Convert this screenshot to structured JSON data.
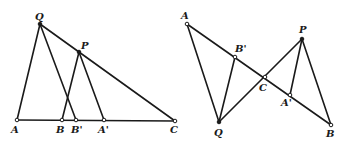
{
  "figures": [
    {
      "id": "left",
      "points": {
        "Q": {
          "label": "Q",
          "x": 40,
          "y": 24,
          "style": "solid",
          "lx": 35,
          "ly": 20
        },
        "P": {
          "label": "P",
          "x": 79,
          "y": 52,
          "style": "solid",
          "lx": 81,
          "ly": 49
        },
        "A": {
          "label": "A",
          "x": 17,
          "y": 120,
          "style": "open",
          "lx": 11,
          "ly": 133
        },
        "B": {
          "label": "B",
          "x": 62,
          "y": 120,
          "style": "open",
          "lx": 56,
          "ly": 133
        },
        "B'": {
          "label": "B'",
          "x": 76,
          "y": 120,
          "style": "open",
          "lx": 71,
          "ly": 133
        },
        "A'": {
          "label": "A'",
          "x": 104,
          "y": 120,
          "style": "open",
          "lx": 98,
          "ly": 133
        },
        "C": {
          "label": "C",
          "x": 175,
          "y": 121,
          "style": "open",
          "lx": 170,
          "ly": 133
        }
      },
      "segments": [
        [
          "A",
          "C"
        ],
        [
          "Q",
          "A"
        ],
        [
          "Q",
          "B'"
        ],
        [
          "Q",
          "C"
        ],
        [
          "P",
          "B"
        ],
        [
          "P",
          "A'"
        ]
      ]
    },
    {
      "id": "right",
      "points": {
        "A": {
          "label": "A",
          "x": 187,
          "y": 24,
          "style": "open",
          "lx": 181,
          "ly": 19
        },
        "B'": {
          "label": "B'",
          "x": 235,
          "y": 57,
          "style": "open",
          "lx": 235,
          "ly": 52
        },
        "C": {
          "label": "C",
          "x": 265,
          "y": 77,
          "style": "open",
          "lx": 259,
          "ly": 91
        },
        "A'": {
          "label": "A'",
          "x": 290,
          "y": 95,
          "style": "open",
          "lx": 281,
          "ly": 106
        },
        "B": {
          "label": "B",
          "x": 331,
          "y": 125,
          "style": "open",
          "lx": 326,
          "ly": 137
        },
        "Q": {
          "label": "Q",
          "x": 219,
          "y": 122,
          "style": "solid",
          "lx": 214,
          "ly": 136
        },
        "P": {
          "label": "P",
          "x": 302,
          "y": 39,
          "style": "solid",
          "lx": 299,
          "ly": 33
        }
      },
      "segments": [
        [
          "A",
          "B"
        ],
        [
          "A",
          "Q"
        ],
        [
          "Q",
          "B'"
        ],
        [
          "Q",
          "P"
        ],
        [
          "P",
          "A'"
        ],
        [
          "P",
          "B"
        ]
      ]
    }
  ]
}
